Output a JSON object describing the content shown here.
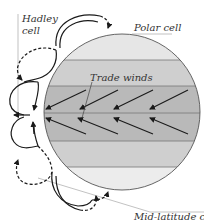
{
  "labels": {
    "hadley_line1": "Hadley",
    "hadley_line2": "cell",
    "polar": "Polar cell",
    "trade_winds": "Trade winds",
    "mid_latitude": "Mid-latitude cell"
  },
  "colors": {
    "band_light": "#e6e6e6",
    "band_mid": "#cfcfcf",
    "band_dark": "#b9b9b9",
    "outline": "#555555",
    "arrow": "#1a1a1a",
    "leader": "#888888"
  },
  "bands": [
    {
      "name": "polar-north",
      "shade": "light"
    },
    {
      "name": "mid-latitude-north",
      "shade": "mid"
    },
    {
      "name": "trade-north",
      "shade": "dark",
      "wind_direction": "down-left",
      "arrows": 4
    },
    {
      "name": "trade-south",
      "shade": "dark",
      "wind_direction": "up-left",
      "arrows": 4
    },
    {
      "name": "mid-latitude-south",
      "shade": "mid"
    },
    {
      "name": "polar-south",
      "shade": "light"
    }
  ]
}
